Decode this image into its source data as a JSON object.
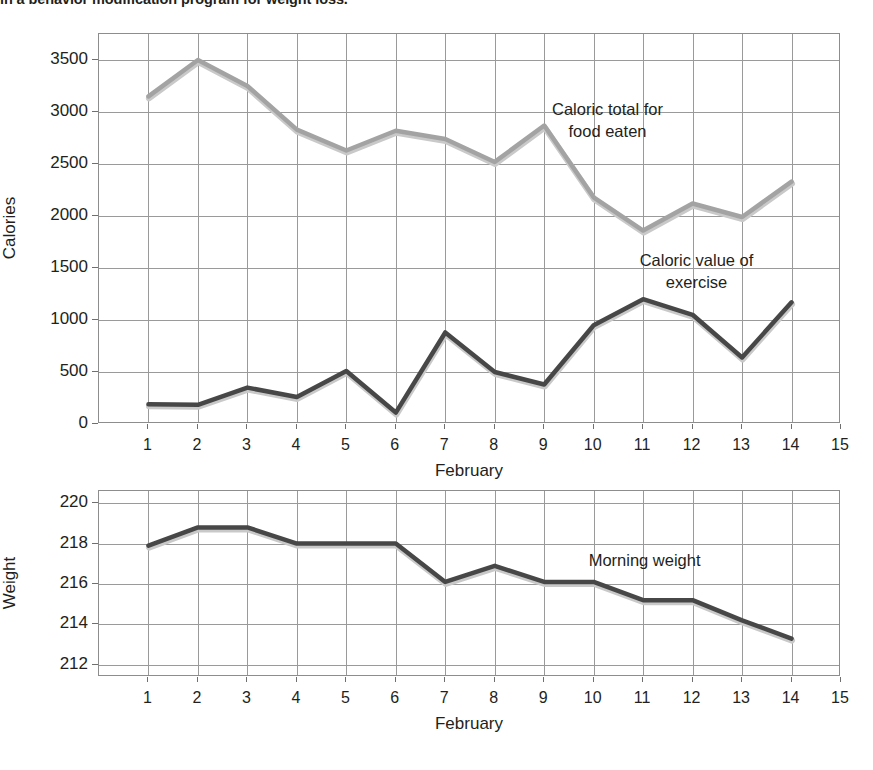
{
  "caption": {
    "text": "in a behavior modification program for weight loss."
  },
  "chart_data": [
    {
      "id": "calories-chart",
      "type": "line",
      "title": "",
      "xlabel": "February",
      "ylabel": "Calories",
      "x": [
        1,
        2,
        3,
        4,
        5,
        6,
        7,
        8,
        9,
        10,
        11,
        12,
        13,
        14
      ],
      "xtick_labels": [
        "1",
        "2",
        "3",
        "4",
        "5",
        "6",
        "7",
        "8",
        "9",
        "10",
        "11",
        "12",
        "13",
        "14",
        "15"
      ],
      "xticks": [
        1,
        2,
        3,
        4,
        5,
        6,
        7,
        8,
        9,
        10,
        11,
        12,
        13,
        14,
        15
      ],
      "xlim": [
        0,
        15
      ],
      "ylim": [
        0,
        3750
      ],
      "yticks": [
        0,
        500,
        1000,
        1500,
        2000,
        2500,
        3000,
        3500
      ],
      "ytick_labels": [
        "0",
        "500",
        "1000",
        "1500",
        "2000",
        "2500",
        "3000",
        "3500"
      ],
      "grid": true,
      "legend": "annotations",
      "series": [
        {
          "name": "Caloric total for food eaten",
          "color": "#a3a3a3",
          "values": [
            3150,
            3500,
            3250,
            2830,
            2630,
            2820,
            2740,
            2520,
            2870,
            2180,
            1860,
            2120,
            1990,
            2330
          ]
        },
        {
          "name": "Caloric value of exercise",
          "color": "#474747",
          "values": [
            190,
            185,
            350,
            260,
            510,
            110,
            880,
            500,
            380,
            950,
            1200,
            1050,
            640,
            1170
          ]
        }
      ],
      "annotations": [
        {
          "text": "Caloric total for\nfood eaten",
          "x": 10.3,
          "y": 2900
        },
        {
          "text": "Caloric value of\nexercise",
          "x": 12.1,
          "y": 1450
        }
      ]
    },
    {
      "id": "weight-chart",
      "type": "line",
      "title": "",
      "xlabel": "February",
      "ylabel": "Weight",
      "x": [
        1,
        2,
        3,
        4,
        5,
        6,
        7,
        8,
        9,
        10,
        11,
        12,
        13,
        14
      ],
      "xtick_labels": [
        "1",
        "2",
        "3",
        "4",
        "5",
        "6",
        "7",
        "8",
        "9",
        "10",
        "11",
        "12",
        "13",
        "14",
        "15"
      ],
      "xticks": [
        1,
        2,
        3,
        4,
        5,
        6,
        7,
        8,
        9,
        10,
        11,
        12,
        13,
        14,
        15
      ],
      "xlim": [
        0,
        15
      ],
      "ylim": [
        211.4,
        220.6
      ],
      "yticks": [
        212,
        214,
        216,
        218,
        220
      ],
      "ytick_labels": [
        "212",
        "214",
        "216",
        "218",
        "220"
      ],
      "grid": true,
      "legend": "annotations",
      "series": [
        {
          "name": "Morning weight",
          "color": "#474747",
          "values": [
            217.9,
            218.8,
            218.8,
            218.0,
            218.0,
            218.0,
            216.1,
            216.9,
            216.1,
            216.1,
            215.2,
            215.2,
            214.2,
            213.3
          ]
        }
      ],
      "annotations": [
        {
          "text": "Morning weight",
          "x": 11.05,
          "y": 217.1
        }
      ]
    }
  ]
}
